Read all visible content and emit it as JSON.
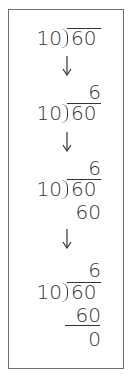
{
  "steps": [
    {
      "divisor": "10",
      "dividend": "60"
    },
    {
      "quotient": "6",
      "divisor": "10",
      "dividend": "60"
    },
    {
      "quotient": "6",
      "divisor": "10",
      "dividend": "60",
      "product": "60"
    },
    {
      "quotient": "6",
      "divisor": "10",
      "dividend": "60",
      "product": "60",
      "remainder": "0"
    }
  ],
  "arrows": [
    "down-arrow-icon",
    "down-arrow-icon",
    "down-arrow-icon"
  ],
  "colors": {
    "ink": "#333333",
    "border": "#6f6f6f",
    "background": "#ffffff"
  }
}
